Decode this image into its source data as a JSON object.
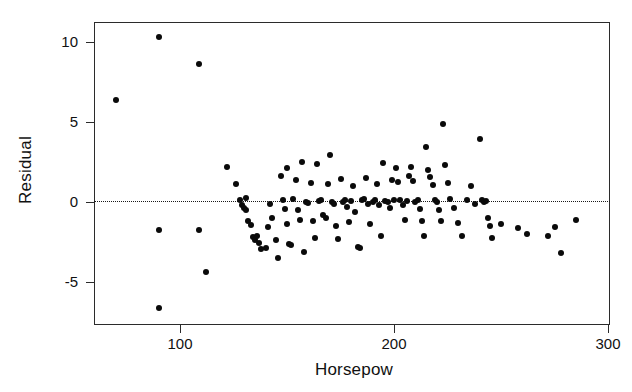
{
  "chart_data": {
    "type": "scatter",
    "title": "",
    "xlabel": "Horsepow",
    "ylabel": "Residual",
    "xlim": [
      62,
      303
    ],
    "ylim": [
      -7.6,
      11.2
    ],
    "xticks": [
      100,
      200,
      300
    ],
    "xtick_labels": [
      "100",
      "200",
      "300"
    ],
    "yticks": [
      -5,
      0,
      5,
      10
    ],
    "ytick_labels": [
      "-5",
      "0",
      "5",
      "10"
    ],
    "grid": false,
    "legend": null,
    "reference_line": {
      "orientation": "horizontal",
      "y": 0,
      "style": "dotted",
      "color": "#1a1a1a"
    },
    "marker": {
      "shape": "circle",
      "filled": true,
      "color": "#0a0a0a",
      "size": 6
    },
    "series": [
      {
        "name": "residuals",
        "points": [
          [
            70,
            6.35
          ],
          [
            90,
            10.3
          ],
          [
            109,
            8.6
          ],
          [
            90,
            -1.75
          ],
          [
            109,
            -1.75
          ],
          [
            112,
            -4.35
          ],
          [
            90,
            -6.65
          ],
          [
            122,
            2.2
          ],
          [
            126,
            1.1
          ],
          [
            128,
            0.1
          ],
          [
            129,
            -0.2
          ],
          [
            130,
            -0.35
          ],
          [
            131,
            -0.5
          ],
          [
            131,
            0.25
          ],
          [
            132,
            -1.2
          ],
          [
            133,
            -1.45
          ],
          [
            134,
            -2.2
          ],
          [
            135,
            -2.35
          ],
          [
            136,
            -2.1
          ],
          [
            137,
            -2.55
          ],
          [
            138,
            -2.95
          ],
          [
            140,
            -2.9
          ],
          [
            141,
            -1.55
          ],
          [
            142,
            -0.15
          ],
          [
            143,
            -1.0
          ],
          [
            145,
            -2.4
          ],
          [
            146,
            -3.5
          ],
          [
            147,
            1.65
          ],
          [
            148,
            0.15
          ],
          [
            149,
            -0.45
          ],
          [
            150,
            -1.35
          ],
          [
            150,
            2.1
          ],
          [
            151,
            -2.6
          ],
          [
            152,
            -2.7
          ],
          [
            153,
            0.2
          ],
          [
            154,
            1.35
          ],
          [
            155,
            -0.5
          ],
          [
            156,
            -1.1
          ],
          [
            157,
            2.5
          ],
          [
            158,
            -3.1
          ],
          [
            159,
            0.0
          ],
          [
            160,
            -0.05
          ],
          [
            161,
            1.2
          ],
          [
            162,
            -1.2
          ],
          [
            163,
            -2.25
          ],
          [
            164,
            2.35
          ],
          [
            165,
            0.05
          ],
          [
            166,
            0.1
          ],
          [
            167,
            -0.8
          ],
          [
            168,
            -1.0
          ],
          [
            169,
            1.1
          ],
          [
            170,
            2.95
          ],
          [
            171,
            0.0
          ],
          [
            172,
            -0.1
          ],
          [
            173,
            -1.5
          ],
          [
            174,
            -2.3
          ],
          [
            175,
            1.45
          ],
          [
            176,
            0.0
          ],
          [
            177,
            0.15
          ],
          [
            178,
            -0.3
          ],
          [
            179,
            -1.25
          ],
          [
            180,
            0.05
          ],
          [
            181,
            1.0
          ],
          [
            182,
            -0.6
          ],
          [
            183,
            -2.8
          ],
          [
            184,
            -2.9
          ],
          [
            185,
            0.1
          ],
          [
            186,
            0.2
          ],
          [
            187,
            1.5
          ],
          [
            188,
            -0.15
          ],
          [
            189,
            -1.35
          ],
          [
            190,
            0.0
          ],
          [
            191,
            0.1
          ],
          [
            192,
            1.15
          ],
          [
            193,
            -0.2
          ],
          [
            194,
            -2.15
          ],
          [
            195,
            2.45
          ],
          [
            196,
            0.05
          ],
          [
            197,
            0.0
          ],
          [
            198,
            -0.35
          ],
          [
            199,
            1.35
          ],
          [
            200,
            0.15
          ],
          [
            201,
            2.1
          ],
          [
            202,
            1.25
          ],
          [
            203,
            0.1
          ],
          [
            204,
            -0.2
          ],
          [
            205,
            -1.1
          ],
          [
            206,
            0.05
          ],
          [
            207,
            1.6
          ],
          [
            208,
            2.2
          ],
          [
            209,
            1.3
          ],
          [
            210,
            0.0
          ],
          [
            211,
            0.15
          ],
          [
            212,
            -0.45
          ],
          [
            213,
            -1.2
          ],
          [
            214,
            -2.1
          ],
          [
            215,
            3.45
          ],
          [
            216,
            2.0
          ],
          [
            217,
            1.55
          ],
          [
            218,
            1.05
          ],
          [
            219,
            0.15
          ],
          [
            220,
            0.0
          ],
          [
            221,
            -0.5
          ],
          [
            222,
            -1.2
          ],
          [
            223,
            4.9
          ],
          [
            224,
            2.3
          ],
          [
            225,
            1.2
          ],
          [
            226,
            0.2
          ],
          [
            228,
            -0.4
          ],
          [
            230,
            -1.3
          ],
          [
            232,
            -2.1
          ],
          [
            234,
            0.1
          ],
          [
            236,
            1.0
          ],
          [
            238,
            -0.15
          ],
          [
            240,
            3.95
          ],
          [
            241,
            0.15
          ],
          [
            242,
            0.0
          ],
          [
            243,
            0.05
          ],
          [
            244,
            -1.0
          ],
          [
            245,
            -1.5
          ],
          [
            246,
            -2.25
          ],
          [
            250,
            -1.4
          ],
          [
            258,
            -1.65
          ],
          [
            262,
            -2.0
          ],
          [
            272,
            -2.15
          ],
          [
            275,
            -1.55
          ],
          [
            278,
            -3.2
          ],
          [
            285,
            -1.1
          ]
        ]
      }
    ]
  },
  "axes": {
    "frame": {
      "left": 94,
      "top": 22,
      "width": 516,
      "height": 303
    },
    "x_map": {
      "value_a": 100,
      "px_a": 180,
      "value_b": 300,
      "px_b": 608
    },
    "y_map": {
      "value_a": 0,
      "px_a": 202,
      "value_b": 10,
      "px_b": 42
    }
  },
  "colors": {
    "ink": "#111111",
    "frame": "#2b2b2b",
    "marker": "#0a0a0a",
    "background": "#ffffff"
  }
}
